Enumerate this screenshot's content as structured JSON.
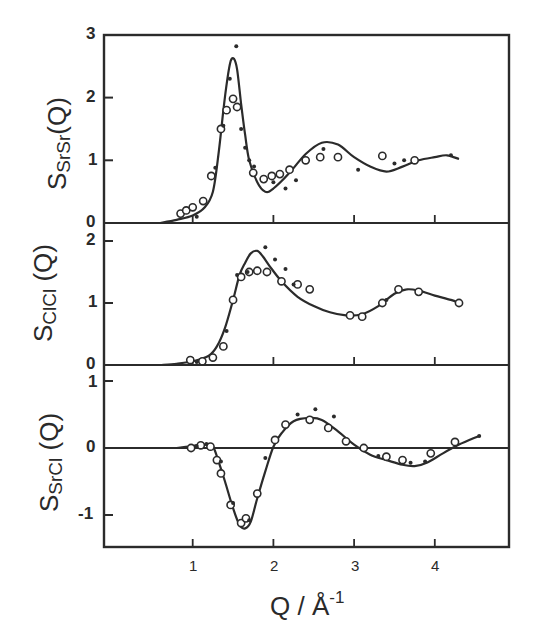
{
  "chart_data": [
    {
      "type": "line",
      "panel": "top",
      "ylabel": "S_SrSr(Q)",
      "ylabel_main": "S",
      "ylabel_sub": "SrSr",
      "ylabel_tail": "(Q)",
      "ylim": [
        0,
        3
      ],
      "yticks": [
        "0",
        "1",
        "2",
        "3"
      ],
      "xlim": [
        -0.1,
        4.9
      ],
      "series": [
        {
          "name": "model (solid line)",
          "style": "line",
          "x": [
            0.6,
            0.8,
            1.0,
            1.15,
            1.25,
            1.32,
            1.38,
            1.43,
            1.47,
            1.51,
            1.55,
            1.6,
            1.65,
            1.7,
            1.8,
            1.9,
            2.0,
            2.2,
            2.4,
            2.6,
            2.8,
            3.0,
            3.2,
            3.4,
            3.6,
            3.8,
            4.0,
            4.15,
            4.3
          ],
          "y": [
            0.0,
            0.05,
            0.12,
            0.25,
            0.5,
            1.1,
            1.8,
            2.3,
            2.58,
            2.62,
            2.45,
            1.9,
            1.4,
            1.0,
            0.65,
            0.5,
            0.55,
            0.8,
            1.1,
            1.28,
            1.25,
            1.05,
            0.9,
            0.82,
            0.9,
            1.0,
            1.05,
            1.08,
            1.02
          ]
        },
        {
          "name": "open circles",
          "style": "open-circle",
          "x": [
            0.85,
            0.92,
            1.0,
            1.13,
            1.23,
            1.35,
            1.42,
            1.5,
            1.55,
            1.75,
            1.88,
            1.98,
            2.08,
            2.2,
            2.4,
            2.58,
            2.8,
            3.35,
            3.75
          ],
          "y": [
            0.15,
            0.2,
            0.25,
            0.35,
            0.75,
            1.5,
            1.8,
            1.98,
            1.85,
            0.8,
            0.7,
            0.75,
            0.78,
            0.85,
            1.0,
            1.05,
            1.05,
            1.07,
            1.0
          ]
        },
        {
          "name": "filled dots",
          "style": "filled-dot",
          "x": [
            1.05,
            1.28,
            1.38,
            1.46,
            1.54,
            1.6,
            1.65,
            1.7,
            1.76,
            2.0,
            2.15,
            2.28,
            2.62,
            3.05,
            3.5,
            3.62,
            4.2
          ],
          "y": [
            0.1,
            0.88,
            1.55,
            2.3,
            2.82,
            1.5,
            1.2,
            1.0,
            0.9,
            0.65,
            0.55,
            0.68,
            1.18,
            0.85,
            0.95,
            1.0,
            1.08
          ]
        }
      ]
    },
    {
      "type": "line",
      "panel": "middle",
      "ylabel": "S_ClCl(Q)",
      "ylabel_main": "S",
      "ylabel_sub": "ClCl",
      "ylabel_tail": " (Q)",
      "ylim": [
        0,
        2.05
      ],
      "yticks": [
        "0",
        "1",
        "2"
      ],
      "series": [
        {
          "name": "model (solid line)",
          "style": "line",
          "x": [
            0.6,
            0.8,
            1.0,
            1.2,
            1.3,
            1.4,
            1.5,
            1.58,
            1.65,
            1.72,
            1.8,
            1.87,
            1.95,
            2.1,
            2.3,
            2.5,
            2.7,
            2.9,
            3.1,
            3.3,
            3.5,
            3.65,
            3.8,
            4.0,
            4.2,
            4.3
          ],
          "y": [
            0.0,
            0.02,
            0.06,
            0.15,
            0.3,
            0.6,
            1.05,
            1.45,
            1.65,
            1.8,
            1.84,
            1.75,
            1.6,
            1.35,
            1.1,
            0.95,
            0.85,
            0.8,
            0.82,
            0.95,
            1.15,
            1.22,
            1.2,
            1.12,
            1.05,
            1.0
          ]
        },
        {
          "name": "open circles",
          "style": "open-circle",
          "x": [
            0.97,
            1.12,
            1.25,
            1.38,
            1.5,
            1.6,
            1.7,
            1.8,
            1.92,
            2.1,
            2.3,
            2.45,
            2.95,
            3.1,
            3.35,
            3.55,
            3.8,
            4.3
          ],
          "y": [
            0.08,
            0.06,
            0.12,
            0.3,
            1.05,
            1.42,
            1.5,
            1.52,
            1.5,
            1.35,
            1.3,
            1.22,
            0.8,
            0.78,
            1.0,
            1.22,
            1.18,
            1.0
          ]
        },
        {
          "name": "filled dots",
          "style": "filled-dot",
          "x": [
            1.05,
            1.42,
            1.55,
            1.68,
            1.9,
            2.02,
            2.15,
            2.25,
            3.4
          ],
          "y": [
            0.05,
            0.55,
            1.45,
            1.5,
            1.9,
            1.7,
            1.55,
            1.3,
            1.05
          ]
        }
      ]
    },
    {
      "type": "line",
      "panel": "bottom",
      "ylabel": "S_SrCl(Q)",
      "ylabel_main": "S",
      "ylabel_sub": "SrCl",
      "ylabel_tail": " (Q)",
      "ylim": [
        -1.5,
        1.0
      ],
      "yticks": [
        "-1",
        "0",
        "1"
      ],
      "zero_line": true,
      "series": [
        {
          "name": "model (solid line)",
          "style": "line",
          "x": [
            0.8,
            1.0,
            1.15,
            1.25,
            1.32,
            1.4,
            1.5,
            1.58,
            1.65,
            1.72,
            1.8,
            1.9,
            2.0,
            2.1,
            2.25,
            2.45,
            2.6,
            2.8,
            3.0,
            3.2,
            3.4,
            3.6,
            3.75,
            3.9,
            4.1,
            4.3,
            4.55
          ],
          "y": [
            0.0,
            0.03,
            0.05,
            0.02,
            -0.2,
            -0.5,
            -0.9,
            -1.15,
            -1.2,
            -1.1,
            -0.75,
            -0.35,
            0.02,
            0.22,
            0.4,
            0.45,
            0.42,
            0.25,
            0.05,
            -0.1,
            -0.18,
            -0.25,
            -0.27,
            -0.22,
            -0.08,
            0.05,
            0.18
          ]
        },
        {
          "name": "open circles",
          "style": "open-circle",
          "x": [
            0.98,
            1.1,
            1.22,
            1.3,
            1.35,
            1.47,
            1.6,
            1.66,
            1.8,
            2.02,
            2.15,
            2.45,
            2.68,
            2.9,
            3.12,
            3.4,
            3.6,
            3.95,
            4.25
          ],
          "y": [
            0.0,
            0.04,
            0.02,
            -0.18,
            -0.38,
            -0.85,
            -1.12,
            -1.05,
            -0.68,
            0.12,
            0.35,
            0.42,
            0.3,
            0.1,
            0.0,
            -0.13,
            -0.18,
            -0.08,
            0.09
          ]
        },
        {
          "name": "filled dots",
          "style": "filled-dot",
          "x": [
            1.05,
            1.17,
            1.35,
            1.5,
            1.7,
            1.9,
            2.3,
            2.52,
            2.75,
            3.3,
            3.7,
            3.88,
            4.55
          ],
          "y": [
            0.03,
            0.06,
            -0.2,
            -0.82,
            -1.08,
            -0.15,
            0.5,
            0.58,
            0.47,
            -0.12,
            -0.22,
            -0.2,
            0.18
          ]
        }
      ]
    }
  ],
  "xaxis": {
    "label_main": "Q / Å",
    "label_sup": "-1",
    "ticks": [
      "1",
      "2",
      "3",
      "4"
    ],
    "tick_values": [
      1,
      2,
      3,
      4
    ]
  }
}
